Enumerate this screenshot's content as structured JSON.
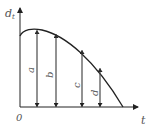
{
  "diagram": {
    "y_axis_label": "d",
    "y_axis_subscript": "t",
    "x_axis_label": "t",
    "origin_label": "0",
    "colors": {
      "stroke": "#222222",
      "text": "#555555",
      "background": "#ffffff"
    },
    "arrows": [
      {
        "label": "a"
      },
      {
        "label": "b"
      },
      {
        "label": "c"
      },
      {
        "label": "d"
      }
    ]
  }
}
